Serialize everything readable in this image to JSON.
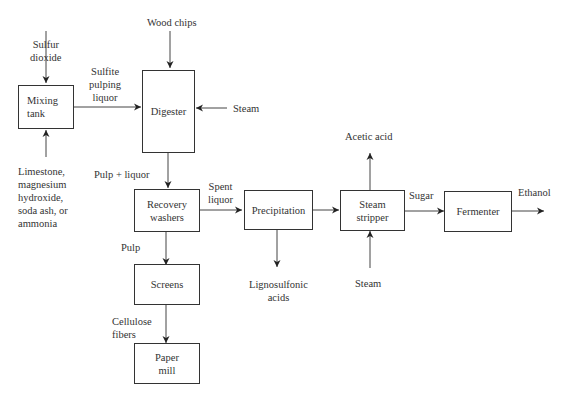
{
  "diagram": {
    "type": "process-flow",
    "title": "",
    "boxes": {
      "mixing_tank": "Mixing\ntank",
      "digester": "Digester",
      "recovery_washers": "Recovery\nwashers",
      "screens": "Screens",
      "paper_mill": "Paper\nmill",
      "precipitation": "Precipitation",
      "steam_stripper": "Steam\nstripper",
      "fermenter": "Fermenter"
    },
    "labels": {
      "sulfur_dioxide": "Sulfur\ndioxide",
      "limestone": "Limestone,\nmagnesium\nhydroxide,\nsoda ash, or\nammonia",
      "sulfite_liquor": "Sulfite\npulping\nliquor",
      "wood_chips": "Wood chips",
      "steam_digester": "Steam",
      "pulp_liquor": "Pulp + liquor",
      "spent_liquor": "Spent\nliquor",
      "pulp": "Pulp",
      "cellulose_fibers": "Cellulose\nfibers",
      "lignosulfonic_acids": "Lignosulfonic\nacids",
      "acetic_acid": "Acetic acid",
      "steam_stripper_in": "Steam",
      "sugar": "Sugar",
      "ethanol": "Ethanol"
    },
    "edges": [
      {
        "from": "Sulfur dioxide",
        "to": "Mixing tank"
      },
      {
        "from": "Limestone, magnesium hydroxide, soda ash, or ammonia",
        "to": "Mixing tank"
      },
      {
        "from": "Mixing tank",
        "to": "Digester",
        "label": "Sulfite pulping liquor"
      },
      {
        "from": "Wood chips",
        "to": "Digester"
      },
      {
        "from": "Steam",
        "to": "Digester"
      },
      {
        "from": "Digester",
        "to": "Recovery washers",
        "label": "Pulp + liquor"
      },
      {
        "from": "Recovery washers",
        "to": "Precipitation",
        "label": "Spent liquor"
      },
      {
        "from": "Recovery washers",
        "to": "Screens",
        "label": "Pulp"
      },
      {
        "from": "Screens",
        "to": "Paper mill",
        "label": "Cellulose fibers"
      },
      {
        "from": "Precipitation",
        "to": "Lignosulfonic acids"
      },
      {
        "from": "Precipitation",
        "to": "Steam stripper"
      },
      {
        "from": "Steam stripper",
        "to": "Acetic acid"
      },
      {
        "from": "Steam",
        "to": "Steam stripper"
      },
      {
        "from": "Steam stripper",
        "to": "Fermenter",
        "label": "Sugar"
      },
      {
        "from": "Fermenter",
        "to": "Ethanol"
      }
    ]
  }
}
